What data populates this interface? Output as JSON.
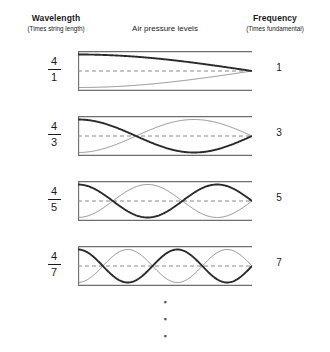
{
  "headers": {
    "left": {
      "title": "Wavelength",
      "subtitle": "(Times string length)"
    },
    "center": {
      "title": "Air pressure levels"
    },
    "right": {
      "title": "Frequency",
      "subtitle": "(Times fundamental)"
    }
  },
  "ellipsis": {
    "dot": "▪"
  },
  "colors": {
    "bold_wave": "#2b2b2b",
    "thin_wave": "#777777",
    "tube_wall": "#6e6e6e",
    "axis_dashed": "#8a8a8a",
    "text": "#1a1a1a"
  },
  "chart_data": {
    "type": "line",
    "title": "Air pressure levels",
    "xlabel": "",
    "ylabel": "",
    "rows": [
      {
        "wavelength_numerator": "4",
        "wavelength_denominator": "1",
        "frequency": "1",
        "harmonic": 1,
        "quarter_waves": 1,
        "node_count": 1,
        "antinode_count": 1,
        "envelope": "cosine",
        "left_end": "closed",
        "right_end": "open"
      },
      {
        "wavelength_numerator": "4",
        "wavelength_denominator": "3",
        "frequency": "3",
        "harmonic": 3,
        "quarter_waves": 3,
        "node_count": 2,
        "antinode_count": 2,
        "envelope": "cosine",
        "left_end": "closed",
        "right_end": "open"
      },
      {
        "wavelength_numerator": "4",
        "wavelength_denominator": "5",
        "frequency": "5",
        "harmonic": 5,
        "quarter_waves": 5,
        "node_count": 3,
        "antinode_count": 3,
        "envelope": "cosine",
        "left_end": "closed",
        "right_end": "open"
      },
      {
        "wavelength_numerator": "4",
        "wavelength_denominator": "7",
        "frequency": "7",
        "harmonic": 7,
        "quarter_waves": 7,
        "node_count": 4,
        "antinode_count": 4,
        "envelope": "cosine",
        "left_end": "closed",
        "right_end": "open"
      }
    ]
  }
}
